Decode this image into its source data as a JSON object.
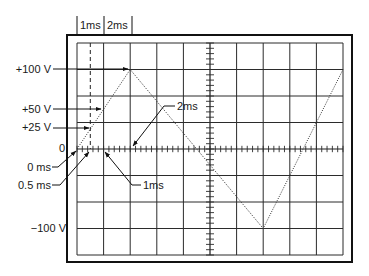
{
  "figure": {
    "top_labels": {
      "first": "1ms",
      "second": "2ms"
    },
    "voltage_labels": {
      "plus_100": "+100 V",
      "plus_50": "+50 V",
      "plus_25": "+25 V",
      "zero": "0",
      "minus_100": "−100 V"
    },
    "time_labels": {
      "zero_ms": "0 ms",
      "half_ms": "0.5 ms",
      "one_ms": "1ms",
      "two_ms": "2ms"
    },
    "colors": {
      "ink": "#1a1a1a",
      "grid": "#2b2b2b",
      "background": "#ffffff"
    }
  },
  "chart_data": {
    "type": "line",
    "xlabel": "time (ms)",
    "ylabel": "voltage (V)",
    "grid": {
      "horizontal_divisions": 10,
      "vertical_divisions": 8,
      "minor_ticks_per_division": 5,
      "shown": true
    },
    "time_per_division_ms": 1,
    "volts_per_division": 33.3,
    "series": [
      {
        "name": "waveform",
        "x": [
          0,
          2,
          7,
          10
        ],
        "y": [
          0,
          100,
          -100,
          100
        ]
      }
    ],
    "markers": [
      {
        "label": "+100 V",
        "x": 2,
        "y": 100
      },
      {
        "label": "+50 V",
        "x": 1,
        "y": 50
      },
      {
        "label": "+25 V",
        "x": 0.5,
        "y": 25
      },
      {
        "label": "0 ms",
        "x": 0,
        "y": 0
      },
      {
        "label": "0.5 ms",
        "x": 0.5,
        "y": 0
      },
      {
        "label": "1ms",
        "x": 1,
        "y": 0
      },
      {
        "label": "2ms",
        "x": 2,
        "y": 0
      },
      {
        "label": "−100 V",
        "x": 7,
        "y": -100
      }
    ],
    "xlim": [
      0,
      10
    ],
    "ylim": [
      -133,
      133
    ]
  }
}
